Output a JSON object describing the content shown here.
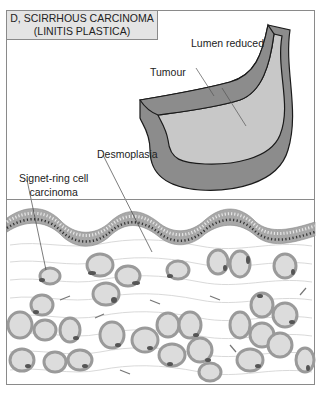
{
  "title": {
    "line1": "D, SCIRRHOUS CARCINOMA",
    "line2": "(LINITIS PLASTICA)"
  },
  "labels": {
    "lumen": "Lumen reduced",
    "tumour": "Tumour",
    "desmoplasia": "Desmoplasia",
    "signet_line1": "Signet-ring cell",
    "signet_line2": "carcinoma"
  },
  "colors": {
    "wall_dark": "#8c8c8c",
    "lumen_light": "#c8c8c8",
    "outline": "#1a1a1a",
    "frame": "#8a8a8a",
    "title_bg": "#e4e4e4",
    "cell_ring": "#9a9a9a",
    "cell_fill": "#dcdcdc",
    "nucleus": "#555555",
    "epithelium": "#a8a8a8"
  }
}
